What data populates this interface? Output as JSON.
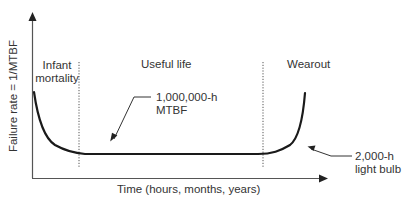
{
  "diagram": {
    "type": "bathtub-curve",
    "axes": {
      "x_label": "Time (hours, months, years)",
      "y_label": "Failure rate = 1/MTBF"
    },
    "regions": [
      {
        "label_line1": "Infant",
        "label_line2": "mortality"
      },
      {
        "label": "Useful life"
      },
      {
        "label": "Wearout"
      }
    ],
    "annotations": [
      {
        "line1": "1,000,000-h",
        "line2": "MTBF"
      },
      {
        "line1": "2,000-h",
        "line2": "light bulb"
      }
    ],
    "colors": {
      "curve": "#1a1a1a",
      "axis": "#555555",
      "divider": "#555555",
      "text": "#333333"
    }
  }
}
